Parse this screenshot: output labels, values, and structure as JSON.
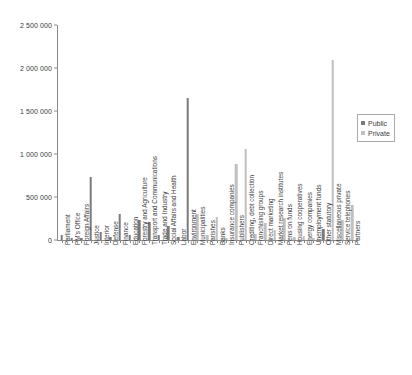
{
  "chart_data": {
    "type": "bar",
    "title": "",
    "subtitle": "",
    "xlabel": "",
    "ylabel": "",
    "ylim": [
      0,
      2500000
    ],
    "ytick_values": [
      0,
      500000,
      1000000,
      1500000,
      2000000,
      2500000
    ],
    "ytick_labels": [
      "0",
      "500 000",
      "1 000 000",
      "1 500 000",
      "2 000 000",
      "2 500 000"
    ],
    "grid": false,
    "legend_position": "right",
    "legend": [
      {
        "name": "Public",
        "color": "#7a7a7a"
      },
      {
        "name": "Private",
        "color": "#c0c0c0"
      }
    ],
    "categories": [
      "Parliament",
      "PM's Office",
      "Foreign Affairs",
      "Justice",
      "Interior",
      "Defense",
      "Finance",
      "Education",
      "Forestry and Agriculture",
      "Transport and Communications",
      "Trade and Industry",
      "Social Affairs and Health",
      "Labor",
      "Environment",
      "Municipalities",
      "Parishes",
      "Banks",
      "Insurance companies",
      "Publishers",
      "Crediting, debt collection",
      "Franchising groups",
      "Direct marketing",
      "Market research institutes",
      "Pens on funds",
      "Housing cooperatives",
      "Energy companies",
      "Unemployment funds",
      "Other statutory",
      "Miscellaneous private",
      "Service telephones",
      "Partners"
    ],
    "series": [
      {
        "name": "Public",
        "color": "#7a7a7a",
        "values": [
          60000,
          25000,
          20000,
          730000,
          90000,
          30000,
          300000,
          60000,
          230000,
          210000,
          60000,
          160000,
          30000,
          1650000,
          0,
          0,
          0,
          0,
          0,
          0,
          0,
          0,
          0,
          0,
          0,
          0,
          0,
          130000,
          0,
          0,
          0
        ]
      },
      {
        "name": "Private",
        "color": "#c0c0c0",
        "values": [
          0,
          0,
          0,
          0,
          0,
          0,
          0,
          0,
          0,
          0,
          0,
          0,
          0,
          0,
          300000,
          60000,
          270000,
          20000,
          880000,
          1060000,
          70000,
          200000,
          120000,
          260000,
          40000,
          50000,
          20000,
          0,
          2090000,
          230000,
          410000
        ]
      }
    ]
  }
}
